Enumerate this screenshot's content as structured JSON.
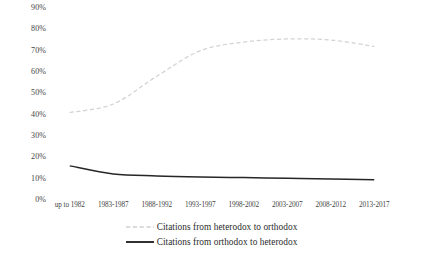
{
  "chart_data": {
    "type": "line",
    "title": "",
    "subtitle": "",
    "xlabel": "",
    "ylabel": "",
    "categories": [
      "up to 1982",
      "1983-1987",
      "1988-1992",
      "1993-1997",
      "1998-2002",
      "2003-2007",
      "2008-2012",
      "2013-2017"
    ],
    "ylim": [
      0,
      90
    ],
    "ytick_labels": [
      "90%",
      "80%",
      "70%",
      "60%",
      "50%",
      "40%",
      "30%",
      "20%",
      "10%",
      "0%"
    ],
    "ytick_values": [
      90,
      80,
      70,
      60,
      50,
      40,
      30,
      20,
      10,
      0
    ],
    "grid": false,
    "legend_position": "bottom",
    "smoothing": "spline",
    "series": [
      {
        "name": "Citations from heterodox to orthodox",
        "style": "dashed",
        "color": "#d3d3d3",
        "values": [
          41,
          45,
          58,
          70,
          74,
          75.5,
          75,
          72
        ]
      },
      {
        "name": "Citations from orthodox to heterodox",
        "style": "solid",
        "color": "#262626",
        "values": [
          16,
          12.2,
          11.3,
          10.8,
          10.5,
          10.2,
          9.9,
          9.5
        ]
      }
    ]
  },
  "legend": {
    "items": [
      {
        "label": "Citations from heterodox to orthodox",
        "marker": "dashed-line-marker"
      },
      {
        "label": "Citations from orthodox to heterodox",
        "marker": "solid-line-marker"
      }
    ]
  }
}
